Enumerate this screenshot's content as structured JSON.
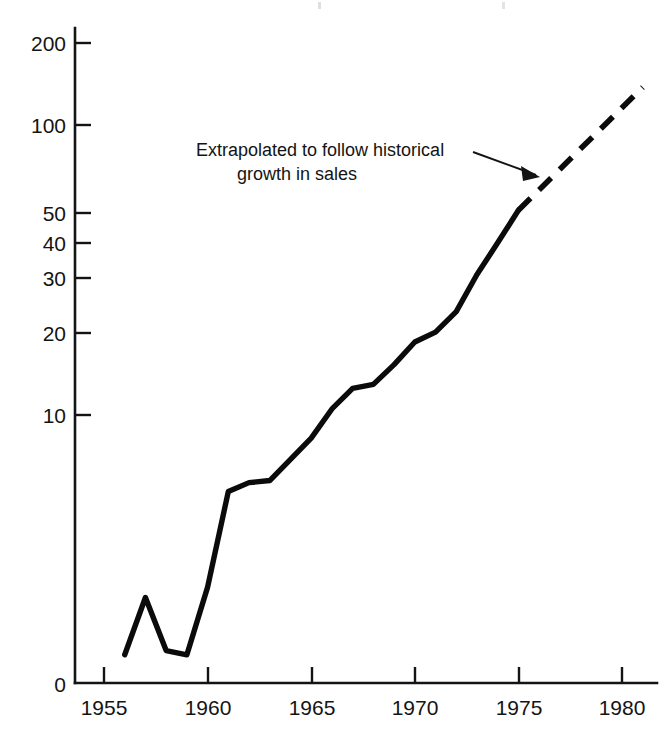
{
  "figure": {
    "background_color": "#ffffff",
    "ink_color": "#111111"
  },
  "annotation": {
    "line1": "Extrapolated to follow historical",
    "line2": "growth in sales",
    "arrow_icon": "arrow-right-icon"
  },
  "axes": {
    "y_ticks": [
      "200",
      "100",
      "50",
      "40",
      "30",
      "20",
      "10",
      "0"
    ],
    "x_ticks": [
      "1955",
      "1960",
      "1965",
      "1970",
      "1975",
      "1980"
    ]
  },
  "chart_data": {
    "type": "line",
    "title": "",
    "xlabel": "",
    "ylabel": "",
    "yscale": "log",
    "grid": false,
    "legend": "none",
    "xlim": [
      1954.2,
      1981.5
    ],
    "ylim": [
      1.0,
      260
    ],
    "y_tick_values": [
      200,
      100,
      50,
      40,
      30,
      20,
      10
    ],
    "y_axis_break_label": "0",
    "x_tick_values": [
      1955,
      1960,
      1965,
      1970,
      1975,
      1980
    ],
    "series": [
      {
        "name": "Historical",
        "style": "solid",
        "x": [
          1956,
          1957,
          1958,
          1959,
          1960,
          1961,
          1962,
          1963,
          1964,
          1965,
          1966,
          1967,
          1968,
          1969,
          1970,
          1971,
          1972,
          1973,
          1974,
          1975
        ],
        "values": [
          1.45,
          2.3,
          1.5,
          1.45,
          2.5,
          5.4,
          5.8,
          5.9,
          7.0,
          8.3,
          10.5,
          12.4,
          12.8,
          15.0,
          18.0,
          19.5,
          23.0,
          31.0,
          40.0,
          52.0
        ]
      },
      {
        "name": "Extrapolated to follow historical growth in sales",
        "style": "dashed",
        "x": [
          1975,
          1981
        ],
        "values": [
          52.0,
          140.0
        ]
      }
    ],
    "annotations": [
      {
        "text": "Extrapolated to follow historical growth in sales",
        "points_to_x": 1976.8,
        "points_to_y": 72
      }
    ]
  }
}
